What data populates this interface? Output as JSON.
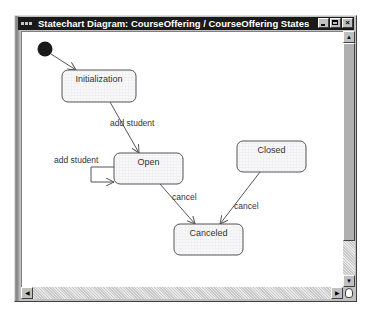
{
  "window": {
    "title": "Statechart Diagram: CourseOffering / CourseOffering States",
    "buttons": {
      "minimize": "_",
      "maximize": "□",
      "close": "×"
    }
  },
  "diagram": {
    "initial_state": {
      "name": "initial"
    },
    "states": [
      {
        "id": "initialization",
        "label": "Initialization"
      },
      {
        "id": "open",
        "label": "Open"
      },
      {
        "id": "closed",
        "label": "Closed"
      },
      {
        "id": "canceled",
        "label": "Canceled"
      }
    ],
    "transitions": [
      {
        "from": "initial",
        "to": "initialization",
        "label": ""
      },
      {
        "from": "initialization",
        "to": "open",
        "label": "add student"
      },
      {
        "from": "open",
        "to": "open",
        "label": "add student"
      },
      {
        "from": "open",
        "to": "canceled",
        "label": "cancel"
      },
      {
        "from": "closed",
        "to": "canceled",
        "label": "cancel"
      }
    ],
    "colors": {
      "state_fill": "#f7f7f7",
      "state_grid": "#e6e6ea",
      "line": "#555555",
      "initial": "#1a1a1a"
    }
  },
  "scrollbars": {
    "vertical": {
      "up": "▲",
      "down": "▼",
      "position": 0
    },
    "horizontal": {
      "left": "◀",
      "right": "▶",
      "position": 0
    }
  }
}
